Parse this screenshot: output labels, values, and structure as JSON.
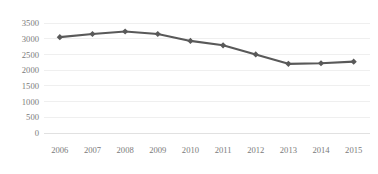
{
  "chart_data": {
    "type": "line",
    "title": "",
    "subtitle": "",
    "xlabel": "",
    "ylabel": "",
    "categories": [
      "2006",
      "2007",
      "2008",
      "2009",
      "2010",
      "2011",
      "2012",
      "2013",
      "2014",
      "2015"
    ],
    "values": [
      3050,
      3150,
      3230,
      3150,
      2930,
      2790,
      2500,
      2200,
      2220,
      2270
    ],
    "series": [
      {
        "name": "",
        "values": [
          3050,
          3150,
          3230,
          3150,
          2930,
          2790,
          2500,
          2200,
          2220,
          2270
        ],
        "color": "#595959",
        "marker": "diamond"
      }
    ],
    "ylim": [
      0,
      3500
    ],
    "yticks": [
      0,
      500,
      1000,
      1500,
      2000,
      2500,
      3000,
      3500
    ],
    "ytick_labels": [
      "0",
      "500",
      "1000",
      "1500",
      "2000",
      "2500",
      "3000",
      "3500"
    ],
    "xtick_labels": [
      "2006",
      "2007",
      "2008",
      "2009",
      "2010",
      "2011",
      "2012",
      "2013",
      "2014",
      "2015"
    ],
    "grid": true,
    "grid_axis": "y",
    "legend": false,
    "legend_position": "none",
    "colors": {
      "series": "#595959",
      "grid": "#e8e8e8",
      "axis": "#d9d9d9",
      "tick_text": "#7a7a7a",
      "background": "#ffffff"
    }
  }
}
